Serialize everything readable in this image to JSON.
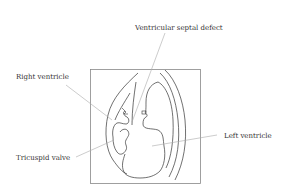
{
  "diagram": {
    "type": "anatomical-illustration",
    "labels": [
      {
        "id": "vsd",
        "text": "Ventricular septal defect"
      },
      {
        "id": "rv",
        "text": "Right ventricle"
      },
      {
        "id": "tv",
        "text": "Tricuspid valve"
      },
      {
        "id": "lv",
        "text": "Left ventricle"
      }
    ],
    "colors": {
      "line": "#333333",
      "leader": "#aaaaaa",
      "frame": "#888888",
      "background": "#ffffff"
    }
  }
}
